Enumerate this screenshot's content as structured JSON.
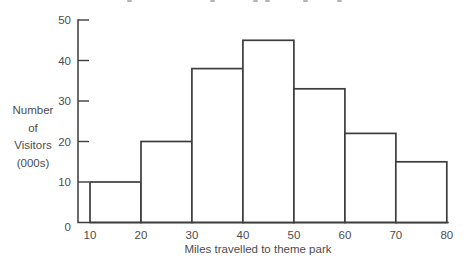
{
  "chart_data": {
    "type": "bar",
    "subtype": "histogram",
    "title": "",
    "xlabel": "Miles travelled to theme park",
    "ylabel": "Number of Visitors (000s)",
    "ylabel_lines": [
      "Number",
      "of",
      "Visitors",
      "(000s)"
    ],
    "bin_edges": [
      10,
      20,
      30,
      40,
      50,
      60,
      70,
      80
    ],
    "categories": [
      "10-20",
      "20-30",
      "30-40",
      "40-50",
      "50-60",
      "60-70",
      "70-80"
    ],
    "values": [
      10,
      20,
      38,
      45,
      33,
      22,
      15
    ],
    "x_tick_labels": [
      "10",
      "20",
      "30",
      "40",
      "50",
      "60",
      "70",
      "80"
    ],
    "y_tick_labels": [
      "0",
      "10",
      "20",
      "30",
      "40",
      "50"
    ],
    "y_tick_values": [
      0,
      10,
      20,
      30,
      40,
      50
    ],
    "xlim": [
      10,
      80
    ],
    "ylim": [
      0,
      50
    ],
    "grid": false,
    "legend": false,
    "bar_fill": "#ffffff",
    "line_color": "#3d3d3d",
    "text_color": "#4d4d4d",
    "background": "#ffffff"
  },
  "clipped_title_fragments": {
    "visible": true,
    "positions_x": [
      127,
      210,
      253,
      265,
      303,
      337
    ],
    "color": "#8f8f8f"
  }
}
